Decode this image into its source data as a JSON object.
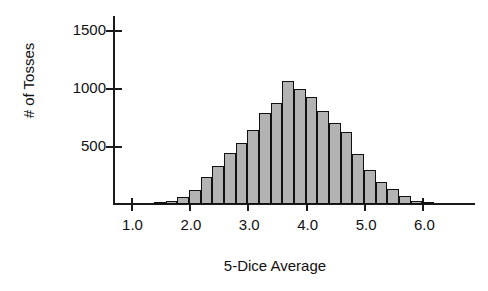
{
  "chart_data": {
    "type": "bar",
    "title": "",
    "xlabel": "5-Dice Average",
    "ylabel": "# of Tosses",
    "xlim": [
      0.7,
      6.9
    ],
    "ylim": [
      0,
      1620
    ],
    "grid": false,
    "legend": null,
    "bin_width": 0.2,
    "xticks": [
      1.0,
      2.0,
      3.0,
      4.0,
      5.0,
      6.0
    ],
    "xtick_labels": [
      "1.0",
      "2.0",
      "3.0",
      "4.0",
      "5.0",
      "6.0"
    ],
    "yticks": [
      500,
      1000,
      1500
    ],
    "ytick_labels": [
      "500",
      "1000",
      "1500"
    ],
    "bar_fill": "#b3b3b3",
    "bar_edge": "#111111",
    "axis_color": "#1a1a1a",
    "bins": [
      {
        "x": 1.4,
        "value": 10
      },
      {
        "x": 1.6,
        "value": 25
      },
      {
        "x": 1.8,
        "value": 60
      },
      {
        "x": 2.0,
        "value": 120
      },
      {
        "x": 2.2,
        "value": 230
      },
      {
        "x": 2.4,
        "value": 330
      },
      {
        "x": 2.6,
        "value": 440
      },
      {
        "x": 2.8,
        "value": 530
      },
      {
        "x": 3.0,
        "value": 640
      },
      {
        "x": 3.2,
        "value": 780
      },
      {
        "x": 3.4,
        "value": 870
      },
      {
        "x": 3.6,
        "value": 1060
      },
      {
        "x": 3.8,
        "value": 990
      },
      {
        "x": 4.0,
        "value": 920
      },
      {
        "x": 4.2,
        "value": 800
      },
      {
        "x": 4.4,
        "value": 700
      },
      {
        "x": 4.6,
        "value": 620
      },
      {
        "x": 4.8,
        "value": 430
      },
      {
        "x": 5.0,
        "value": 290
      },
      {
        "x": 5.2,
        "value": 190
      },
      {
        "x": 5.4,
        "value": 130
      },
      {
        "x": 5.6,
        "value": 70
      },
      {
        "x": 5.8,
        "value": 30
      },
      {
        "x": 6.0,
        "value": 12
      }
    ]
  }
}
